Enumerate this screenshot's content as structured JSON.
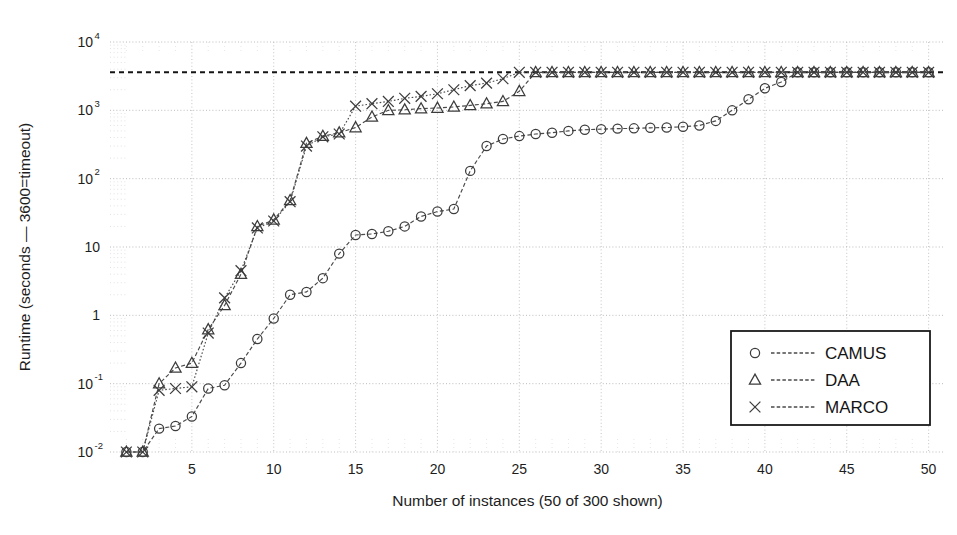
{
  "chart_data": {
    "type": "line",
    "title": "",
    "xlabel": "Number of instances (50 of 300 shown)",
    "ylabel": "Runtime (seconds — 3600=timeout)",
    "xlim": [
      0,
      51
    ],
    "ylim": [
      0.01,
      10000
    ],
    "yscale": "log",
    "xscale": "linear",
    "grid": true,
    "legend_position": "lower right",
    "xticks": [
      5,
      10,
      15,
      20,
      25,
      30,
      35,
      40,
      45,
      50
    ],
    "xtick_labels": [
      "5",
      "10",
      "15",
      "20",
      "25",
      "30",
      "35",
      "40",
      "45",
      "50"
    ],
    "yticks": [
      0.01,
      0.1,
      1,
      10,
      100,
      1000,
      10000
    ],
    "ytick_labels": [
      "10⁻²",
      "10⁻¹",
      "1",
      "10",
      "10²",
      "10³",
      "10⁴"
    ],
    "ytick_mantissas": [
      "10",
      "10",
      "1",
      "10",
      "10",
      "10",
      "10"
    ],
    "ytick_exponents": [
      "-2",
      "-1",
      "",
      "",
      "2",
      "3",
      "4"
    ],
    "annotations": [
      {
        "name": "timeout-line",
        "type": "hline",
        "y": 3600,
        "style": "dashed",
        "label": "3600 = timeout"
      }
    ],
    "x": [
      1,
      2,
      3,
      4,
      5,
      6,
      7,
      8,
      9,
      10,
      11,
      12,
      13,
      14,
      15,
      16,
      17,
      18,
      19,
      20,
      21,
      22,
      23,
      24,
      25,
      26,
      27,
      28,
      29,
      30,
      31,
      32,
      33,
      34,
      35,
      36,
      37,
      38,
      39,
      40,
      41,
      42,
      43,
      44,
      45,
      46,
      47,
      48,
      49,
      50
    ],
    "series": [
      {
        "name": "CAMUS",
        "marker": "circle",
        "linestyle": "dashed",
        "color": "#444444",
        "values": [
          0.01,
          0.01,
          0.022,
          0.024,
          0.033,
          0.085,
          0.095,
          0.2,
          0.45,
          0.9,
          2.0,
          2.2,
          3.5,
          8.0,
          15.0,
          15.5,
          17.0,
          20.0,
          28.0,
          33.0,
          36.0,
          130.0,
          300.0,
          380.0,
          420.0,
          450.0,
          470.0,
          500.0,
          520.0,
          530.0,
          540.0,
          545.0,
          555.0,
          560.0,
          575.0,
          600.0,
          700.0,
          1000.0,
          1450.0,
          2100.0,
          2600.0,
          3600.0,
          3600.0,
          3600.0,
          3600.0,
          3600.0,
          3600.0,
          3600.0,
          3600.0,
          3600.0
        ]
      },
      {
        "name": "DAA",
        "marker": "triangle",
        "linestyle": "dashed",
        "color": "#444444",
        "values": [
          0.01,
          0.01,
          0.1,
          0.17,
          0.2,
          0.62,
          1.4,
          4.0,
          20.0,
          25.0,
          48.0,
          330.0,
          420.0,
          470.0,
          560.0,
          800.0,
          1000.0,
          1020.0,
          1060.0,
          1080.0,
          1120.0,
          1180.0,
          1250.0,
          1350.0,
          1900.0,
          3600.0,
          3600.0,
          3600.0,
          3600.0,
          3600.0,
          3600.0,
          3600.0,
          3600.0,
          3600.0,
          3600.0,
          3600.0,
          3600.0,
          3600.0,
          3600.0,
          3600.0,
          3600.0,
          3600.0,
          3600.0,
          3600.0,
          3600.0,
          3600.0,
          3600.0,
          3600.0,
          3600.0,
          3600.0
        ]
      },
      {
        "name": "MARCO",
        "marker": "cross",
        "linestyle": "dotted",
        "color": "#444444",
        "values": [
          0.01,
          0.01,
          0.08,
          0.085,
          0.09,
          0.55,
          1.8,
          4.5,
          19.0,
          24.0,
          46.0,
          300.0,
          410.0,
          450.0,
          1150.0,
          1250.0,
          1350.0,
          1500.0,
          1600.0,
          1750.0,
          2000.0,
          2300.0,
          2500.0,
          2900.0,
          3600.0,
          3600.0,
          3600.0,
          3600.0,
          3600.0,
          3600.0,
          3600.0,
          3600.0,
          3600.0,
          3600.0,
          3600.0,
          3600.0,
          3600.0,
          3600.0,
          3600.0,
          3600.0,
          3600.0,
          3600.0,
          3600.0,
          3600.0,
          3600.0,
          3600.0,
          3600.0,
          3600.0,
          3600.0,
          3600.0
        ]
      }
    ],
    "legend": [
      {
        "label": "CAMUS",
        "marker": "circle"
      },
      {
        "label": "DAA",
        "marker": "triangle"
      },
      {
        "label": "MARCO",
        "marker": "cross"
      }
    ]
  },
  "colors": {
    "background": "#ffffff",
    "line": "#4a4a4a",
    "grid_major": "#b4b4b4",
    "grid_minor": "#d8d8d8",
    "timeout": "#151515",
    "text": "#1d1d1d"
  }
}
